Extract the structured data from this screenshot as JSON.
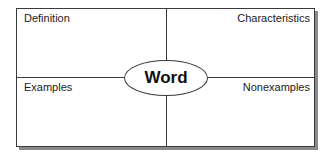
{
  "diagram": {
    "type": "frayer-model",
    "center": {
      "label": "Word"
    },
    "quadrants": {
      "top_left": {
        "label": "Definition"
      },
      "top_right": {
        "label": "Characteristics"
      },
      "bottom_left": {
        "label": "Examples"
      },
      "bottom_right": {
        "label": "Nonexamples"
      }
    },
    "colors": {
      "line": "#3a3a3a",
      "shadow": "#8a8a8a",
      "background": "#ffffff",
      "text": "#1a1a1a"
    }
  }
}
